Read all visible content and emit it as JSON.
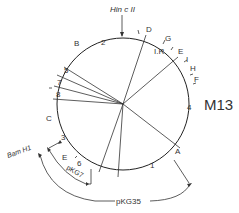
{
  "title": "M13",
  "enzyme_site": "Hin c II",
  "bamh1_label": "Bam H1",
  "ir_label": "I.R.",
  "fragment_letters": [
    {
      "id": "A",
      "x": 175,
      "y": 154
    },
    {
      "id": "B",
      "x": 75,
      "y": 44
    },
    {
      "id": "C",
      "x": 47,
      "y": 120
    },
    {
      "id": "D",
      "x": 148,
      "y": 30
    },
    {
      "id": "E",
      "x": 179,
      "y": 52
    },
    {
      "id": "E2",
      "label": "E",
      "x": 62,
      "y": 158
    },
    {
      "id": "F",
      "x": 195,
      "y": 81
    },
    {
      "id": "G",
      "x": 166,
      "y": 39
    },
    {
      "id": "H",
      "x": 191,
      "y": 69
    },
    {
      "id": "I",
      "x": 187,
      "y": 61
    }
  ],
  "fragment_numbers": [
    {
      "id": "1",
      "x": 150,
      "y": 166
    },
    {
      "id": "2",
      "x": 103,
      "y": 43
    },
    {
      "id": "3",
      "x": 62,
      "y": 138
    },
    {
      "id": "4",
      "x": 189,
      "y": 108
    },
    {
      "id": "5",
      "x": 66,
      "y": 72
    },
    {
      "id": "6",
      "x": 78,
      "y": 164
    },
    {
      "id": "7",
      "x": 58,
      "y": 84
    },
    {
      "id": "8",
      "x": 57,
      "y": 96
    }
  ],
  "clones": [
    {
      "label": "pKG7",
      "x": 66,
      "y": 164
    },
    {
      "label": "pKG35",
      "x": 95,
      "y": 200
    }
  ]
}
